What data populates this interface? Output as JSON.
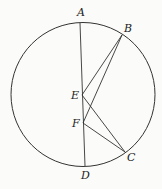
{
  "figure": {
    "type": "geometry",
    "circle": {
      "cx": 83,
      "cy": 94.5,
      "r": 72
    },
    "points": {
      "A": {
        "label": "A",
        "x": 80,
        "y": 23,
        "lx": 77,
        "ly": 16
      },
      "B": {
        "label": "B",
        "x": 122,
        "y": 35,
        "lx": 124,
        "ly": 32
      },
      "E": {
        "label": "E",
        "x": 82,
        "y": 95,
        "lx": 71,
        "ly": 99
      },
      "F": {
        "label": "F",
        "x": 83,
        "y": 123,
        "lx": 72,
        "ly": 127
      },
      "C": {
        "label": "C",
        "x": 125,
        "y": 152,
        "lx": 127,
        "ly": 161
      },
      "D": {
        "label": "D",
        "x": 85,
        "y": 166,
        "lx": 81,
        "ly": 179
      }
    },
    "segments": [
      [
        "A",
        "D"
      ],
      [
        "E",
        "B"
      ],
      [
        "F",
        "B"
      ],
      [
        "E",
        "C"
      ],
      [
        "F",
        "C"
      ]
    ],
    "stroke_color": "#333333"
  }
}
